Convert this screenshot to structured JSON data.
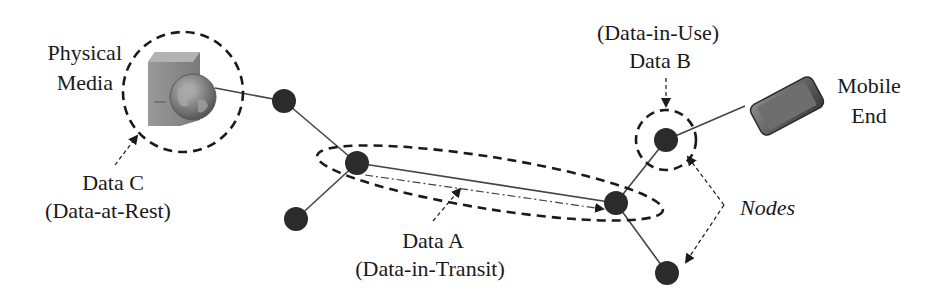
{
  "diagram": {
    "type": "network-data-states",
    "labels": {
      "physical_media_line1": "Physical",
      "physical_media_line2": "Media",
      "data_c_line1": "Data C",
      "data_c_line2": "(Data-at-Rest)",
      "data_a_line1": "Data A",
      "data_a_line2": "(Data-in-Transit)",
      "data_b_line1": "(Data-in-Use)",
      "data_b_line2": "Data B",
      "mobile_line1": "Mobile",
      "mobile_line2": "End",
      "nodes": "Nodes"
    },
    "icons": {
      "server": "server-with-globe-icon",
      "mobile": "smartphone-icon"
    },
    "nodes": [
      {
        "id": "n1",
        "x": 284,
        "y": 101
      },
      {
        "id": "n2",
        "x": 357,
        "y": 163
      },
      {
        "id": "n3",
        "x": 296,
        "y": 219
      },
      {
        "id": "n4",
        "x": 616,
        "y": 203
      },
      {
        "id": "n5",
        "x": 666,
        "y": 140
      },
      {
        "id": "n6",
        "x": 667,
        "y": 273
      }
    ],
    "edges": [
      [
        "server",
        "n1"
      ],
      [
        "n1",
        "n2"
      ],
      [
        "n2",
        "n3"
      ],
      [
        "n2",
        "n4"
      ],
      [
        "n4",
        "n5"
      ],
      [
        "n4",
        "n6"
      ],
      [
        "n5",
        "mobile"
      ]
    ],
    "colors": {
      "node": "#2b2b2b",
      "line": "#444444",
      "server": "#8a8a8a",
      "globe": "#707070",
      "text": "#1a1a1a"
    }
  }
}
